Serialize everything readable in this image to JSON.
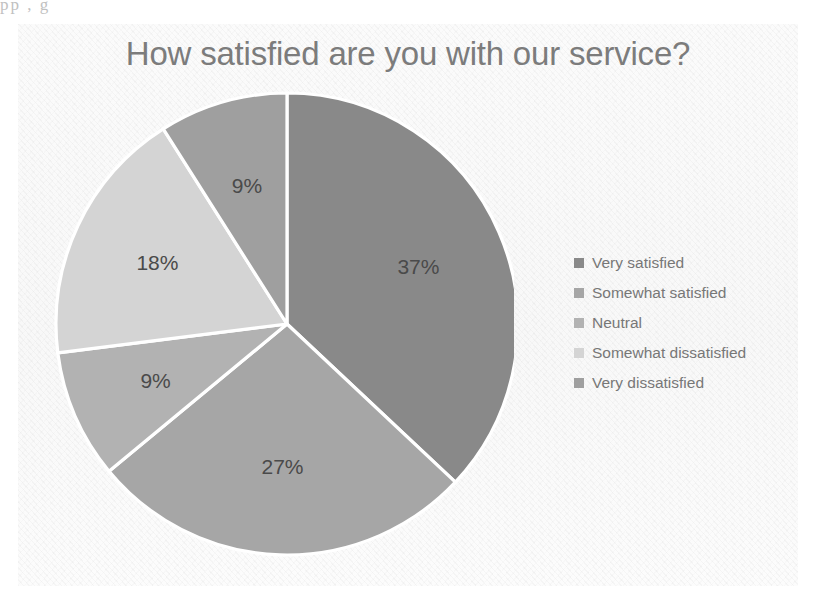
{
  "scan": {
    "top_line_fragment": "pp                                                                 ,                                  g"
  },
  "chart_data": {
    "type": "pie",
    "title": "How satisfied are you with our service?",
    "categories": [
      "Very satisfied",
      "Somewhat satisfied",
      "Neutral",
      "Somewhat dissatisfied",
      "Very dissatisfied"
    ],
    "values": [
      37,
      27,
      9,
      18,
      9
    ],
    "value_labels": [
      "37%",
      "27%",
      "9%",
      "18%",
      "9%"
    ],
    "colors": [
      "#898989",
      "#a6a6a6",
      "#b2b2b2",
      "#d4d4d4",
      "#9f9f9f"
    ],
    "slice_border_color": "#ffffff",
    "start_angle_deg": 0,
    "direction": "clockwise",
    "legend_position": "right",
    "grid": false,
    "xlabel": "",
    "ylabel": "",
    "background_color": "#fafafa",
    "title_color": "#7c7c7c",
    "label_color": "#4a4a4a"
  },
  "legend": {
    "items": [
      {
        "label": "Very satisfied",
        "color": "#898989"
      },
      {
        "label": "Somewhat satisfied",
        "color": "#a6a6a6"
      },
      {
        "label": "Neutral",
        "color": "#b2b2b2"
      },
      {
        "label": "Somewhat dissatisfied",
        "color": "#d4d4d4"
      },
      {
        "label": "Very dissatisfied",
        "color": "#9f9f9f"
      }
    ]
  }
}
